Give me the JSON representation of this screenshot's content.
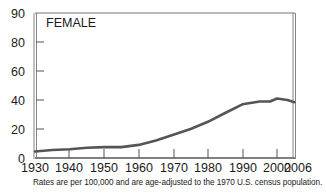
{
  "chart_data": {
    "type": "line",
    "title": "",
    "panel_label": "FEMALE",
    "xlabel": "",
    "ylabel": "",
    "x_ticks": [
      "1930",
      "1940",
      "1950",
      "1960",
      "1970",
      "1980",
      "1990",
      "2000",
      "2006"
    ],
    "y_ticks": [
      "0",
      "20",
      "40",
      "60",
      "80",
      "90"
    ],
    "xlim": [
      1930,
      2006
    ],
    "ylim": [
      0,
      90
    ],
    "grid": false,
    "legend": null,
    "series": [
      {
        "name": "Female",
        "color": "#555555",
        "x": [
          1930,
          1935,
          1940,
          1945,
          1950,
          1955,
          1960,
          1965,
          1970,
          1975,
          1980,
          1985,
          1990,
          1995,
          1998,
          2000,
          2003,
          2005
        ],
        "values": [
          4.5,
          5.5,
          6,
          7,
          7.5,
          7.5,
          9,
          12,
          16,
          20,
          25,
          31,
          37,
          39,
          39,
          41,
          40,
          38.5
        ]
      }
    ],
    "footnote": "Rates are per 100,000 and are age-adjusted to the 1970 U.S. census population."
  },
  "labels": {
    "panel": "FEMALE",
    "footnote": "Rates are per 100,000 and are age-adjusted to the 1970 U.S. census population."
  },
  "layout": {
    "plot_left": 35,
    "plot_right": 293,
    "plot_top": 13,
    "plot_bottom": 158,
    "x_px": {
      "1930": 35,
      "1940": 69,
      "1950": 104,
      "1960": 139,
      "1970": 174,
      "1980": 208,
      "1990": 243,
      "2000": 277,
      "2006": 298
    },
    "y_px": {
      "0": 158,
      "20": 129,
      "40": 100,
      "60": 71,
      "80": 42,
      "90": 13
    }
  }
}
